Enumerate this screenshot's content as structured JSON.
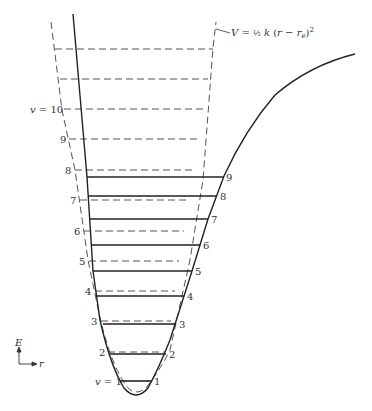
{
  "diagram": {
    "harmonic_label": {
      "prefix": "V = ",
      "frac": "½",
      "rest": " k (r − r",
      "sub": "e",
      "close": ")",
      "sup": "2"
    },
    "axes": {
      "y_label": "E",
      "x_label": "r"
    },
    "harmonic_levels": [
      {
        "label": "",
        "y": 49
      },
      {
        "label": "",
        "y": 79
      },
      {
        "label": "v = 10",
        "y": 109
      },
      {
        "label": "9",
        "y": 139
      },
      {
        "label": "8",
        "y": 170
      },
      {
        "label": "7",
        "y": 200
      },
      {
        "label": "6",
        "y": 231
      },
      {
        "label": "5",
        "y": 261
      },
      {
        "label": "4",
        "y": 291
      },
      {
        "label": "3",
        "y": 321
      },
      {
        "label": "2",
        "y": 352
      }
    ],
    "morse_levels": [
      {
        "label": "v = 1",
        "right_label": "1",
        "y": 381,
        "x1": 120,
        "x2": 152
      },
      {
        "label": "",
        "right_label": "2",
        "y": 354,
        "x1": 110,
        "x2": 166
      },
      {
        "label": "",
        "right_label": "3",
        "y": 324,
        "x1": 103,
        "x2": 176
      },
      {
        "label": "",
        "right_label": "4",
        "y": 296,
        "x1": 96,
        "x2": 184
      },
      {
        "label": "",
        "right_label": "5",
        "y": 271,
        "x1": 93,
        "x2": 192
      },
      {
        "label": "",
        "right_label": "6",
        "y": 245,
        "x1": 91,
        "x2": 200
      },
      {
        "label": "",
        "right_label": "7",
        "y": 219,
        "x1": 89,
        "x2": 208
      },
      {
        "label": "",
        "right_label": "8",
        "y": 196,
        "x1": 88,
        "x2": 217
      },
      {
        "label": "",
        "right_label": "9",
        "y": 177,
        "x1": 87,
        "x2": 223
      }
    ],
    "colors": {
      "line": "#222222",
      "dashed": "#555555",
      "text": "#333333"
    }
  }
}
